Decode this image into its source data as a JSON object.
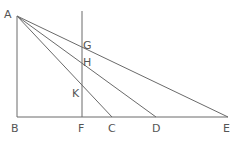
{
  "diagram": {
    "type": "geometry-figure",
    "points": {
      "A": "A",
      "B": "B",
      "C": "C",
      "D": "D",
      "E": "E",
      "F": "F",
      "G": "G",
      "H": "H",
      "K": "K"
    },
    "segments": [
      [
        "A",
        "B"
      ],
      [
        "B",
        "E"
      ],
      [
        "F",
        "top"
      ],
      [
        "A",
        "C"
      ],
      [
        "A",
        "D"
      ],
      [
        "A",
        "E"
      ]
    ],
    "colors": {
      "line": "#6a6a6a",
      "label": "#555555",
      "background": "#ffffff"
    }
  }
}
